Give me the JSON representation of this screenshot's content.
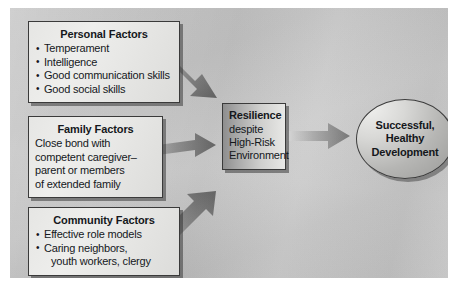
{
  "figure": {
    "background_color": "#c6c6c6",
    "frame_color": "#ffffff"
  },
  "nodes": {
    "personal": {
      "title": "Personal Factors",
      "items": [
        "Temperament",
        "Intelligence",
        "Good communication skills",
        "Good social skills"
      ]
    },
    "family": {
      "title": "Family Factors",
      "lines": [
        "Close bond with",
        "competent caregiver–",
        "parent or members",
        "of extended family"
      ]
    },
    "community": {
      "title": "Community Factors",
      "items": [
        "Effective role models",
        "Caring neighbors,",
        "youth workers, clergy"
      ]
    },
    "resilience": {
      "title": "Resilience",
      "lines": [
        "despite",
        "High-Risk",
        "Environment"
      ]
    },
    "outcome": {
      "lines": [
        "Successful,",
        "Healthy",
        "Development"
      ]
    }
  },
  "arrows": [
    {
      "name": "personal-to-resilience",
      "from": "Personal Factors",
      "to": "Resilience",
      "direction": "down-right"
    },
    {
      "name": "family-to-resilience",
      "from": "Family Factors",
      "to": "Resilience",
      "direction": "right"
    },
    {
      "name": "community-to-resilience",
      "from": "Community Factors",
      "to": "Resilience",
      "direction": "up-right"
    },
    {
      "name": "resilience-to-outcome",
      "from": "Resilience",
      "to": "Successful, Healthy Development",
      "direction": "right"
    }
  ],
  "colors": {
    "canvas": "#c6c6c6",
    "box_fill_light": "#e9e9e7",
    "box_border": "#3a3a3a",
    "arrow_dark": "#6f6f6f",
    "arrow_light": "#c2c2c2",
    "text": "#15181c"
  }
}
